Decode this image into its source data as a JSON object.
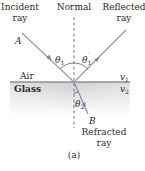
{
  "figure": {
    "caption": "(a)",
    "labels": {
      "incident_line1": "Incident",
      "incident_line2": "ray",
      "normal": "Normal",
      "reflected_line1": "Reflected",
      "reflected_line2": "ray",
      "point_a": "A",
      "point_b": "B",
      "medium_top": "Air",
      "medium_bottom": "Glass",
      "v1": "v",
      "v1_sub": "1",
      "v2": "v",
      "v2_sub": "2",
      "theta1": "θ",
      "theta1_sub": "1",
      "theta1p": "θ",
      "theta1p_sub": "1",
      "theta1p_prime": "′",
      "theta2": "θ",
      "theta2_sub": "2",
      "refracted_line1": "Refracted",
      "refracted_line2": "ray"
    },
    "colors": {
      "ray": "#8a9bb0",
      "normal": "#555555",
      "interface": "#9a9a9a",
      "glass_top": "#d4d4d4",
      "glass_bottom": "#ffffff",
      "text": "#2a2a2a"
    }
  }
}
